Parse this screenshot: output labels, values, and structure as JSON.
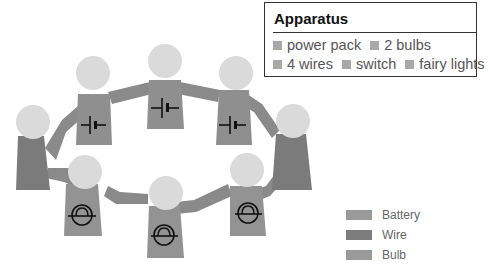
{
  "apparatus": {
    "title": "Apparatus",
    "items": [
      "power pack",
      "2 bulbs",
      "4 wires",
      "switch",
      "fairy lights"
    ],
    "item_icon": "square-bullet-icon"
  },
  "legend": {
    "items": [
      {
        "label": "Battery",
        "color": "#9a9a9a"
      },
      {
        "label": "Wire",
        "color": "#7d7d7d"
      },
      {
        "label": "Bulb",
        "color": "#9a9a9a"
      }
    ]
  },
  "colors": {
    "head": "#dadada",
    "battery_body": "#8f8f8f",
    "wire_body": "#7b7b7b",
    "bulb_body": "#939393",
    "symbol": "#111111"
  },
  "figures": [
    {
      "role": "wire",
      "symbol": "none",
      "position": "left"
    },
    {
      "role": "battery",
      "symbol": "battery-cell-icon",
      "position": "upper-left"
    },
    {
      "role": "battery",
      "symbol": "battery-cell-icon",
      "position": "top"
    },
    {
      "role": "battery",
      "symbol": "battery-cell-icon",
      "position": "upper-right"
    },
    {
      "role": "wire",
      "symbol": "none",
      "position": "right"
    },
    {
      "role": "bulb",
      "symbol": "bulb-lamp-icon",
      "position": "lower-right"
    },
    {
      "role": "bulb",
      "symbol": "bulb-lamp-icon",
      "position": "bottom"
    },
    {
      "role": "bulb",
      "symbol": "bulb-lamp-icon",
      "position": "lower-left"
    }
  ]
}
